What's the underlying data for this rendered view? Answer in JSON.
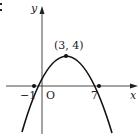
{
  "figure": {
    "type": "parabola-graph",
    "axes": {
      "x_label": "x",
      "y_label": "y",
      "origin_label": "O"
    },
    "points": [
      {
        "name": "vertex",
        "label": "(3, 4)",
        "x": 3,
        "y": 4
      },
      {
        "name": "left-root",
        "label": "−1",
        "x": -1,
        "y": 0
      },
      {
        "name": "right-root",
        "label": "7",
        "x": 7,
        "y": 0
      }
    ],
    "corner_mark": ":",
    "colors": {
      "stroke": "#111111",
      "background": "#ffffff"
    }
  }
}
